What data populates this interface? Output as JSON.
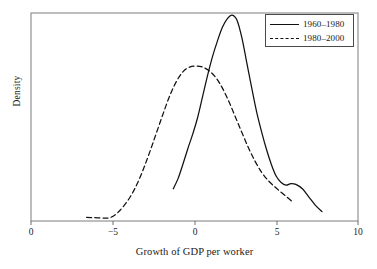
{
  "chart_data": {
    "type": "line",
    "title": "",
    "xlabel": "Growth of GDP per worker",
    "ylabel": "Density",
    "xlim": [
      -10,
      10
    ],
    "ylim": [
      0,
      1
    ],
    "grid": false,
    "legend_position": "top-right",
    "xticks": [
      {
        "value": -10,
        "label": "0",
        "px": 31
      },
      {
        "value": -5,
        "label": "−5",
        "px": 113
      },
      {
        "value": 0,
        "label": "0",
        "px": 195
      },
      {
        "value": 5,
        "label": "5",
        "px": 277
      },
      {
        "value": 10,
        "label": "10",
        "px": 358
      }
    ],
    "yticks": [],
    "series": [
      {
        "name": "1960–1980",
        "style": "solid",
        "color": "#111111",
        "points": [
          [
            -1.3,
            0.155
          ],
          [
            -1.0,
            0.205
          ],
          [
            -0.7,
            0.275
          ],
          [
            -0.4,
            0.35
          ],
          [
            -0.1,
            0.42
          ],
          [
            0.2,
            0.5
          ],
          [
            0.5,
            0.6
          ],
          [
            0.8,
            0.7
          ],
          [
            1.1,
            0.79
          ],
          [
            1.4,
            0.865
          ],
          [
            1.7,
            0.93
          ],
          [
            2.0,
            0.972
          ],
          [
            2.3,
            0.99
          ],
          [
            2.6,
            0.965
          ],
          [
            2.9,
            0.88
          ],
          [
            3.2,
            0.76
          ],
          [
            3.5,
            0.64
          ],
          [
            3.8,
            0.525
          ],
          [
            4.1,
            0.43
          ],
          [
            4.4,
            0.345
          ],
          [
            4.7,
            0.272
          ],
          [
            5.0,
            0.215
          ],
          [
            5.3,
            0.185
          ],
          [
            5.6,
            0.172
          ],
          [
            5.9,
            0.18
          ],
          [
            6.2,
            0.176
          ],
          [
            6.6,
            0.155
          ],
          [
            7.0,
            0.115
          ],
          [
            7.4,
            0.075
          ],
          [
            7.8,
            0.045
          ]
        ]
      },
      {
        "name": "1980–2000",
        "style": "dashed",
        "color": "#111111",
        "points": [
          [
            -6.6,
            0.018
          ],
          [
            -6.2,
            0.016
          ],
          [
            -5.8,
            0.015
          ],
          [
            -5.4,
            0.014
          ],
          [
            -5.1,
            0.018
          ],
          [
            -4.7,
            0.04
          ],
          [
            -4.3,
            0.075
          ],
          [
            -3.9,
            0.12
          ],
          [
            -3.5,
            0.18
          ],
          [
            -3.1,
            0.255
          ],
          [
            -2.7,
            0.34
          ],
          [
            -2.3,
            0.43
          ],
          [
            -1.9,
            0.52
          ],
          [
            -1.5,
            0.605
          ],
          [
            -1.1,
            0.672
          ],
          [
            -0.7,
            0.718
          ],
          [
            -0.3,
            0.74
          ],
          [
            0.1,
            0.745
          ],
          [
            0.5,
            0.74
          ],
          [
            0.9,
            0.722
          ],
          [
            1.3,
            0.69
          ],
          [
            1.7,
            0.64
          ],
          [
            2.1,
            0.575
          ],
          [
            2.5,
            0.5
          ],
          [
            2.9,
            0.425
          ],
          [
            3.3,
            0.352
          ],
          [
            3.7,
            0.288
          ],
          [
            4.1,
            0.235
          ],
          [
            4.5,
            0.195
          ],
          [
            4.9,
            0.165
          ],
          [
            5.3,
            0.138
          ],
          [
            5.7,
            0.112
          ],
          [
            6.0,
            0.092
          ]
        ]
      }
    ],
    "legend": [
      {
        "label": "1960–1980",
        "style": "solid"
      },
      {
        "label": "1980–2000",
        "style": "dashed"
      }
    ]
  }
}
